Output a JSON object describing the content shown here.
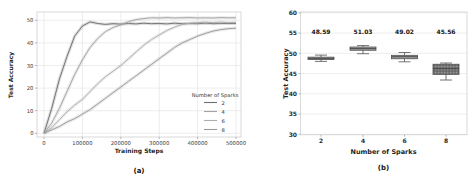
{
  "figure": {
    "captions": {
      "a": "(a)",
      "b": "(b)"
    }
  },
  "colors": {
    "grid": "#e0e0e0",
    "spine": "#c9c9c9",
    "tick_mark": "#8a8a8a",
    "box_edge": "#4f4f4f",
    "median": "#3f3f3f"
  },
  "chart_data": [
    {
      "type": "line",
      "title": "",
      "xlabel": "Training Steps",
      "ylabel": "Test Accuracy",
      "xlim": [
        0,
        500000
      ],
      "ylim": [
        0,
        52
      ],
      "grid": true,
      "legend": {
        "title": "Number of Sparks",
        "position": "lower right"
      },
      "xticks": [
        0,
        100000,
        200000,
        300000,
        400000,
        500000
      ],
      "xtick_labels": [
        "0",
        "100000",
        "200000",
        "300000",
        "400000",
        "500000"
      ],
      "yticks": [
        0,
        10,
        20,
        30,
        40,
        50
      ],
      "ytick_labels": [
        "0",
        "10",
        "20",
        "30",
        "40",
        "50"
      ],
      "x": [
        0,
        20000,
        40000,
        60000,
        80000,
        100000,
        120000,
        140000,
        160000,
        180000,
        200000,
        220000,
        240000,
        260000,
        280000,
        300000,
        320000,
        340000,
        360000,
        380000,
        400000,
        420000,
        440000,
        460000,
        480000,
        500000
      ],
      "series": [
        {
          "name": "2",
          "color": "#6f6f6f",
          "values": [
            0,
            11,
            24,
            34,
            43,
            47.5,
            49.3,
            48.6,
            48.2,
            48.5,
            48.3,
            48.6,
            48.4,
            48.7,
            48.5,
            48.6,
            48.4,
            48.7,
            48.5,
            48.6,
            48.5,
            48.7,
            48.5,
            48.6,
            48.6,
            48.6
          ]
        },
        {
          "name": "4",
          "color": "#a3a3a3",
          "values": [
            0,
            4.5,
            11,
            18.5,
            26,
            32.5,
            38,
            42,
            45,
            46.8,
            48,
            49.4,
            50.3,
            50.8,
            51.1,
            51.0,
            51.2,
            51.0,
            51.1,
            51.2,
            51.0,
            51.1,
            51.0,
            51.2,
            51.1,
            51.1
          ]
        },
        {
          "name": "6",
          "color": "#aeaeae",
          "values": [
            0,
            2.5,
            6,
            9.5,
            12.5,
            15,
            18.5,
            22,
            25,
            27.5,
            30,
            33,
            36,
            39,
            41.5,
            43.5,
            45.5,
            47,
            48.2,
            48.7,
            49.0,
            49.1,
            49.0,
            49.2,
            49.0,
            49.1
          ]
        },
        {
          "name": "8",
          "color": "#9b9b9b",
          "values": [
            0,
            1.5,
            3,
            5,
            6.5,
            8.5,
            10.5,
            13,
            15.5,
            18,
            20.5,
            23,
            25.5,
            28,
            30.5,
            33,
            35.5,
            38,
            40,
            41.5,
            43,
            44.2,
            45.2,
            45.9,
            46.3,
            46.5
          ]
        }
      ]
    },
    {
      "type": "box",
      "title": "",
      "xlabel": "Number of Sparks",
      "ylabel": "Test Accuracy",
      "ylim": [
        30,
        60
      ],
      "grid": true,
      "yticks": [
        30,
        35,
        40,
        45,
        50,
        55,
        60
      ],
      "ytick_labels": [
        "30",
        "35",
        "40",
        "45",
        "50",
        "55",
        "60"
      ],
      "categories": [
        "2",
        "4",
        "6",
        "8"
      ],
      "mean_labels": [
        "48.59",
        "51.03",
        "49.02",
        "45.56"
      ],
      "boxes": [
        {
          "whisker_low": 48.0,
          "q1": 48.45,
          "median": 48.75,
          "q3": 49.05,
          "whisker_high": 49.55,
          "fill": "#a4a4a4",
          "hatch": false
        },
        {
          "whisker_low": 49.9,
          "q1": 50.75,
          "median": 51.15,
          "q3": 51.55,
          "whisker_high": 51.9,
          "fill": "#a4a4a4",
          "hatch": false
        },
        {
          "whisker_low": 47.9,
          "q1": 48.65,
          "median": 49.15,
          "q3": 49.5,
          "whisker_high": 50.2,
          "fill": "#a4a4a4",
          "hatch": false
        },
        {
          "whisker_low": 43.4,
          "q1": 44.8,
          "median": 46.2,
          "q3": 47.3,
          "whisker_high": 47.6,
          "fill": "#757575",
          "hatch": true
        }
      ]
    }
  ]
}
